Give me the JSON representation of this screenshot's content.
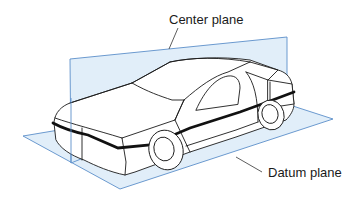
{
  "diagram": {
    "labels": {
      "center_plane": "Center plane",
      "datum_plane": "Datum plane"
    },
    "colors": {
      "plane_fill": "#dcebf8",
      "plane_edge": "#5b8fc9",
      "outline": "#1a1a1a",
      "molding_stripe": "#111111",
      "background": "#ffffff"
    }
  }
}
